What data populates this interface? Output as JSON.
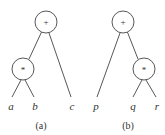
{
  "figure": {
    "trees": [
      {
        "caption": "(a)",
        "root": {
          "op": "+"
        },
        "inner": {
          "op": "*"
        },
        "leaves": [
          "a",
          "b",
          "c"
        ]
      },
      {
        "caption": "(b)",
        "root": {
          "op": "+"
        },
        "inner": {
          "op": "*"
        },
        "leaves": [
          "p",
          "q",
          "r"
        ]
      }
    ]
  }
}
